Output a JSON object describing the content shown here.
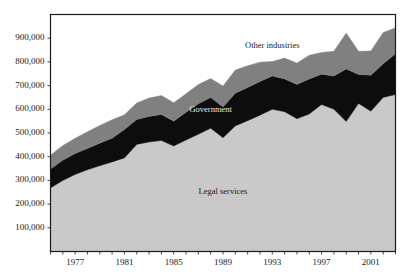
{
  "chart_data": {
    "type": "area",
    "stacked": true,
    "title": "",
    "subtitle": "",
    "xlabel": "",
    "ylabel": "",
    "xlim": [
      1975,
      2003
    ],
    "ylim": [
      0,
      1000000
    ],
    "grid": false,
    "legend_position": "inline-annotations",
    "x": [
      1975,
      1976,
      1977,
      1978,
      1979,
      1980,
      1981,
      1982,
      1983,
      1984,
      1985,
      1986,
      1987,
      1988,
      1989,
      1990,
      1991,
      1992,
      1993,
      1994,
      1995,
      1996,
      1997,
      1998,
      1999,
      2000,
      2001,
      2002,
      2003
    ],
    "xtick_values": [
      1975,
      1976,
      1977,
      1978,
      1979,
      1980,
      1981,
      1982,
      1983,
      1984,
      1985,
      1986,
      1987,
      1988,
      1989,
      1990,
      1991,
      1992,
      1993,
      1994,
      1995,
      1996,
      1997,
      1998,
      1999,
      2000,
      2001,
      2002,
      2003
    ],
    "xtick_labels": [
      "",
      "",
      "1977",
      "",
      "",
      "",
      "1981",
      "",
      "",
      "",
      "1985",
      "",
      "",
      "",
      "1989",
      "",
      "",
      "",
      "1993",
      "",
      "",
      "",
      "1997",
      "",
      "",
      "",
      "2001",
      "",
      ""
    ],
    "ytick_values": [
      100000,
      200000,
      300000,
      400000,
      500000,
      600000,
      700000,
      800000,
      900000
    ],
    "ytick_labels": [
      "100,000",
      "200,000",
      "300,000",
      "400,000",
      "500,000",
      "600,000",
      "700,000",
      "800,000",
      "900,000"
    ],
    "series": [
      {
        "name": "Legal services",
        "color": "#c9c9c9",
        "label_x": 1989,
        "label_y": 250000,
        "label_color": "dark",
        "values": [
          268000,
          300000,
          325000,
          345000,
          362000,
          378000,
          395000,
          452000,
          462000,
          468000,
          445000,
          470000,
          495000,
          520000,
          480000,
          530000,
          552000,
          575000,
          600000,
          590000,
          560000,
          580000,
          620000,
          600000,
          548000,
          625000,
          592000,
          650000,
          662000
        ]
      },
      {
        "name": "Government",
        "color": "#0d0d0d",
        "label_x": 1988,
        "label_y": 595000,
        "label_color": "light",
        "values": [
          80000,
          85000,
          88000,
          90000,
          95000,
          100000,
          120000,
          105000,
          108000,
          110000,
          105000,
          118000,
          128000,
          130000,
          130000,
          138000,
          140000,
          142000,
          140000,
          138000,
          145000,
          148000,
          128000,
          140000,
          222000,
          122000,
          152000,
          142000,
          172000
        ]
      },
      {
        "name": "Other industries",
        "color": "#808080",
        "label_x": 1993,
        "label_y": 868000,
        "label_color": "dark",
        "values": [
          58000,
          62000,
          65000,
          70000,
          75000,
          78000,
          62000,
          70000,
          78000,
          80000,
          78000,
          78000,
          82000,
          80000,
          88000,
          98000,
          92000,
          82000,
          62000,
          88000,
          90000,
          100000,
          92000,
          105000,
          152000,
          98000,
          102000,
          132000,
          110000
        ]
      }
    ]
  },
  "axes": {
    "frame_color": "#1a1a1a",
    "background": "#ffffff",
    "page_background": "#ffffff"
  }
}
